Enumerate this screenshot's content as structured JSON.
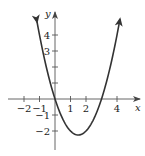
{
  "chart_data": {
    "type": "line",
    "title": "",
    "xlabel": "x",
    "ylabel": "y",
    "function": "y = x^2 - 3x",
    "xlim": [
      -2.5,
      4.5
    ],
    "ylim": [
      -2.8,
      5.0
    ],
    "x_ticks": [
      -2,
      -1,
      1,
      2,
      4
    ],
    "x_tick_labels": [
      "−2",
      "−1",
      "1",
      "2",
      "4"
    ],
    "y_ticks": [
      4,
      3,
      2,
      1,
      -1,
      -2
    ],
    "y_tick_labels": [
      "4",
      "3",
      "",
      "",
      "−1",
      "−2"
    ],
    "series": [
      {
        "name": "parabola",
        "x": [
          -1.16,
          -1,
          -0.5,
          0,
          0.5,
          1,
          1.5,
          2,
          2.5,
          3,
          3.5,
          4,
          4.19
        ],
        "y": [
          4.83,
          4,
          1.75,
          0,
          -1.25,
          -2,
          -2.25,
          -2,
          -1.25,
          0,
          1.75,
          4,
          5.0
        ]
      }
    ],
    "x_intercepts": [
      0,
      3
    ],
    "vertex": [
      1.5,
      -2.25
    ],
    "grid": false,
    "arrows_on_curve_ends": true,
    "line_color": "#333333"
  }
}
